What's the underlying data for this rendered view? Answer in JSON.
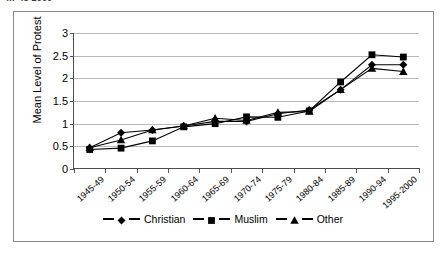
{
  "cutoff_caption": "…-45 2000",
  "chart_data": {
    "type": "line",
    "title": "",
    "xlabel": "",
    "ylabel": "Mean Level of Protest",
    "ylim": [
      0,
      3
    ],
    "ytick_values": [
      0,
      0.5,
      1,
      1.5,
      2,
      2.5,
      3
    ],
    "ytick_labels": [
      "0",
      "0.5",
      "1",
      "1.5",
      "2",
      "2.5",
      "3"
    ],
    "grid": true,
    "legend_position": "bottom-center",
    "categories": [
      "1945-49",
      "1950-54",
      "1955-59",
      "1960-64",
      "1965-69",
      "1970-74",
      "1975-79",
      "1980-84",
      "1985-89",
      "1990-94",
      "1995-2000"
    ],
    "series": [
      {
        "name": "Christian",
        "marker": "diamond",
        "color": "#000000",
        "values": [
          0.47,
          0.8,
          0.86,
          0.95,
          1.05,
          1.05,
          1.22,
          1.3,
          1.75,
          2.3,
          2.3
        ]
      },
      {
        "name": "Muslim",
        "marker": "square",
        "color": "#000000",
        "values": [
          0.43,
          0.46,
          0.62,
          0.93,
          1.0,
          1.15,
          1.14,
          1.28,
          1.92,
          2.52,
          2.47
        ]
      },
      {
        "name": "Other",
        "marker": "triangle",
        "color": "#000000",
        "values": [
          0.47,
          0.64,
          0.86,
          0.95,
          1.12,
          1.07,
          1.25,
          1.27,
          1.75,
          2.22,
          2.15
        ]
      }
    ]
  }
}
